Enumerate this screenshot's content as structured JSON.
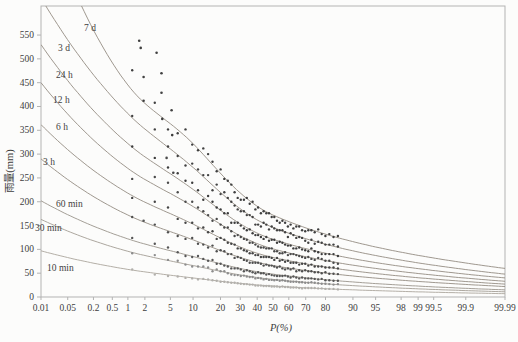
{
  "chart_data": {
    "type": "scatter+line",
    "title": "",
    "xlabel": "P(%)",
    "ylabel": "雨量(mm)",
    "x_scale": "normal-probability",
    "xlim": [
      0.01,
      99.99
    ],
    "ylim": [
      0,
      611
    ],
    "grid": false,
    "legend_position": "inline-curve-labels",
    "x_tick_labels": [
      "0.01",
      "0.05",
      "0.2",
      "0.5",
      "1",
      "2",
      "5",
      "10",
      "20",
      "30",
      "40",
      "50",
      "60",
      "70",
      "80",
      "90",
      "95",
      "98",
      "99",
      "99.5",
      "99.9",
      "99.99"
    ],
    "x_ticks": [
      0.01,
      0.05,
      0.2,
      0.5,
      1,
      2,
      5,
      10,
      20,
      30,
      40,
      50,
      60,
      70,
      80,
      90,
      95,
      98,
      99,
      99.5,
      99.9,
      99.99
    ],
    "y_ticks": [
      0,
      50,
      100,
      150,
      200,
      250,
      300,
      350,
      400,
      450,
      500,
      550
    ],
    "series": [
      {
        "name": "7 d",
        "label_px": [
          84,
          31
        ],
        "curve_color": "#948c82",
        "dot_color": "#3f3f3f",
        "curve": {
          "p": [
            0.01,
            1,
            10,
            50,
            99.99
          ],
          "v": [
            820,
            445,
            322,
            172,
            60
          ]
        },
        "outliers": [
          [
            1.6,
            538
          ],
          [
            1.7,
            523
          ],
          [
            3.1,
            513
          ],
          [
            3.7,
            470
          ]
        ],
        "scatter": {
          "n": 58,
          "p_max": 85.5,
          "noise": 0.05,
          "seed": 1077
        }
      },
      {
        "name": "3 d",
        "label_px": [
          58,
          51
        ],
        "curve_color": "#948c82",
        "dot_color": "#424242",
        "curve": {
          "p": [
            0.01,
            1,
            10,
            50,
            99.99
          ],
          "v": [
            628,
            385,
            272,
            146,
            48
          ]
        },
        "outliers": [
          [
            1.9,
            462
          ],
          [
            3.7,
            429
          ],
          [
            5.2,
            392
          ]
        ],
        "scatter": {
          "n": 58,
          "p_max": 85.5,
          "noise": 0.05,
          "seed": 1154
        }
      },
      {
        "name": "24 h",
        "label_px": [
          56,
          78
        ],
        "curve_color": "#948c82",
        "dot_color": "#3c3c3c",
        "curve": {
          "p": [
            0.01,
            1,
            10,
            50,
            99.99
          ],
          "v": [
            530,
            322,
            226,
            121,
            40
          ]
        },
        "outliers": [
          [
            1.9,
            412
          ],
          [
            3.8,
            374
          ],
          [
            5.3,
            340
          ]
        ],
        "scatter": {
          "n": 58,
          "p_max": 85.5,
          "noise": 0.045,
          "seed": 1231
        }
      },
      {
        "name": "12 h",
        "label_px": [
          53,
          103
        ],
        "curve_color": "#948c82",
        "dot_color": "#4a4a4a",
        "curve": {
          "p": [
            0.01,
            1,
            10,
            50,
            99.99
          ],
          "v": [
            450,
            270,
            190,
            101,
            33
          ]
        },
        "outliers": [
          [
            4.4,
            292
          ]
        ],
        "scatter": {
          "n": 58,
          "p_max": 85.5,
          "noise": 0.045,
          "seed": 1308
        }
      },
      {
        "name": "6 h",
        "label_px": [
          56,
          130
        ],
        "curve_color": "#948c82",
        "dot_color": "#454545",
        "curve": {
          "p": [
            0.01,
            1,
            10,
            50,
            99.99
          ],
          "v": [
            362,
            218,
            153,
            83,
            27
          ]
        },
        "outliers": [
          [
            5.5,
            261
          ]
        ],
        "scatter": {
          "n": 58,
          "p_max": 85.5,
          "noise": 0.04,
          "seed": 1385
        }
      },
      {
        "name": "3 h",
        "label_px": [
          43,
          165
        ],
        "curve_color": "#948c82",
        "dot_color": "#4f4f4f",
        "curve": {
          "p": [
            0.01,
            1,
            10,
            50,
            99.99
          ],
          "v": [
            290,
            172,
            120,
            66,
            22
          ]
        },
        "outliers": [],
        "scatter": {
          "n": 58,
          "p_max": 85.5,
          "noise": 0.04,
          "seed": 1462
        }
      },
      {
        "name": "60 min",
        "label_px": [
          56,
          207
        ],
        "curve_color": "#9a948b",
        "dot_color": "#565656",
        "curve": {
          "p": [
            0.01,
            1,
            10,
            50,
            99.99
          ],
          "v": [
            202,
            122,
            85,
            48,
            15
          ]
        },
        "outliers": [
          [
            1.9,
            160
          ]
        ],
        "scatter": {
          "n": 58,
          "p_max": 85.5,
          "noise": 0.04,
          "seed": 1539
        }
      },
      {
        "name": "30 min",
        "label_px": [
          35,
          231
        ],
        "curve_color": "#a39d94",
        "dot_color": "#8d8d8d",
        "curve": {
          "p": [
            0.01,
            1,
            10,
            50,
            99.99
          ],
          "v": [
            163,
            96,
            66,
            37,
            11
          ]
        },
        "outliers": [],
        "scatter": {
          "n": 58,
          "p_max": 85.5,
          "noise": 0.04,
          "seed": 1616
        }
      },
      {
        "name": "10 min",
        "label_px": [
          47,
          271
        ],
        "curve_color": "#aba69d",
        "dot_color": "#b2b0ac",
        "curve": {
          "p": [
            0.01,
            1,
            10,
            50,
            99.99
          ],
          "v": [
            97,
            58,
            40,
            23,
            7
          ]
        },
        "outliers": [],
        "scatter": {
          "n": 58,
          "p_max": 85.5,
          "noise": 0.04,
          "seed": 1693
        }
      }
    ],
    "colors": {
      "frame": "#b3b3b3",
      "axis_text": "#3e3e3e",
      "background": "#fcfcfb"
    }
  }
}
